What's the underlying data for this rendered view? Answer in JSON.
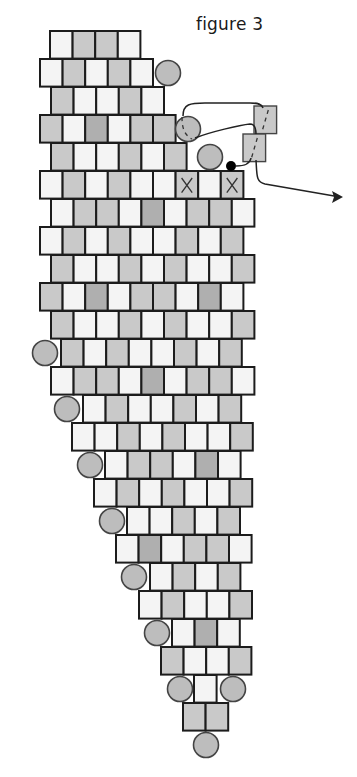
{
  "figure": {
    "title": "figure 3",
    "colors": {
      "white_bead": "#f4f4f4",
      "gray_bead": "#c9c9c9",
      "dark_bead": "#afafaf",
      "round_bead": "#bdbdbd",
      "outline": "#1c1c1c",
      "thread": "#222222",
      "background": "#ffffff"
    },
    "bead": {
      "width": 22.6,
      "height": 27.6
    },
    "legend_codes": {
      "W": "white cylinder bead",
      "G": "gray cylinder bead",
      "D": "dark gray cylinder bead",
      "X": "gray bead marked X"
    },
    "rows": [
      {
        "y": 31,
        "x": 50,
        "beads": "WGGW"
      },
      {
        "y": 59,
        "x": 40,
        "beads": "WGWGW"
      },
      {
        "y": 87,
        "x": 51,
        "beads": "GWWGW"
      },
      {
        "y": 115,
        "x": 40,
        "beads": "GWDWGG"
      },
      {
        "y": 143,
        "x": 51,
        "beads": "GWWGWG"
      },
      {
        "y": 171,
        "x": 40,
        "beads": "WGWGWWXWX"
      },
      {
        "y": 199,
        "x": 51,
        "beads": "WGGWDWGGW"
      },
      {
        "y": 227,
        "x": 40,
        "beads": "WGWGWWGWG"
      },
      {
        "y": 255,
        "x": 51,
        "beads": "GWWGWGWWG"
      },
      {
        "y": 283,
        "x": 40,
        "beads": "GWDWGGWDW"
      },
      {
        "y": 311,
        "x": 51,
        "beads": "GWWGWGWWG"
      },
      {
        "y": 339,
        "x": 61,
        "beads": "GWGWWGWG"
      },
      {
        "y": 367,
        "x": 51,
        "beads": "WGGWDWGGW"
      },
      {
        "y": 395,
        "x": 83,
        "beads": "WGWWGWG"
      },
      {
        "y": 423,
        "x": 72,
        "beads": "WWGWGWWG"
      },
      {
        "y": 451,
        "x": 105,
        "beads": "WGGWDW"
      },
      {
        "y": 479,
        "x": 94,
        "beads": "WGWGWWG"
      },
      {
        "y": 507,
        "x": 127,
        "beads": "WWGWG"
      },
      {
        "y": 535,
        "x": 116,
        "beads": "WDWGGW"
      },
      {
        "y": 563,
        "x": 150,
        "beads": "WGWG"
      },
      {
        "y": 591,
        "x": 139,
        "beads": "WGWWG"
      },
      {
        "y": 619,
        "x": 172,
        "beads": "WDW"
      },
      {
        "y": 647,
        "x": 161,
        "beads": "GWWG"
      },
      {
        "y": 675,
        "x": 194,
        "beads": "W"
      },
      {
        "y": 703,
        "x": 183,
        "beads": "GG"
      }
    ],
    "round_beads": [
      {
        "cx": 168,
        "cy": 73,
        "r": 12.5,
        "dashed": false
      },
      {
        "cx": 188,
        "cy": 129,
        "r": 12.5,
        "dashed": true
      },
      {
        "cx": 210,
        "cy": 157,
        "r": 12.5,
        "dashed": false
      },
      {
        "cx": 45,
        "cy": 353,
        "r": 12.5,
        "dashed": false
      },
      {
        "cx": 67,
        "cy": 409,
        "r": 12.5,
        "dashed": false
      },
      {
        "cx": 90,
        "cy": 465,
        "r": 12.5,
        "dashed": false
      },
      {
        "cx": 112,
        "cy": 521,
        "r": 12.5,
        "dashed": false
      },
      {
        "cx": 134,
        "cy": 577,
        "r": 12.5,
        "dashed": false
      },
      {
        "cx": 157,
        "cy": 633,
        "r": 12.5,
        "dashed": false
      },
      {
        "cx": 180,
        "cy": 689,
        "r": 12.5,
        "dashed": false
      },
      {
        "cx": 233,
        "cy": 689,
        "r": 12.5,
        "dashed": false
      },
      {
        "cx": 206,
        "cy": 745,
        "r": 12.5,
        "dashed": false
      }
    ],
    "loose_beads": [
      {
        "x": 254,
        "y": 106,
        "w": 22.6,
        "h": 27.6,
        "type": "G"
      },
      {
        "x": 243,
        "y": 134,
        "w": 22.6,
        "h": 27.6,
        "type": "G"
      }
    ],
    "thread_knot": {
      "cx": 231,
      "cy": 166,
      "r": 5
    },
    "thread_path": {
      "loop": "M183,116 C183,104 190,103 205,103 L250,103 C258,103 262,104 263,108 M195,138 C210,132 240,125 250,124 C254,124 256,128 256,134",
      "knot_to_bead": "M236,166 C244,166 250,164 251,158",
      "exit": "M256,160 C257,176 256,182 265,184 L340,197",
      "arrow_head": "M343,197 L332,191 L334,197 L332,203 Z"
    }
  }
}
